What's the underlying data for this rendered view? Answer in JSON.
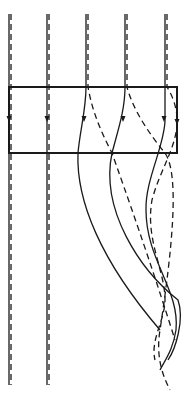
{
  "diagram": {
    "colors": {
      "stroke": "#1a1a1a",
      "background": "#ffffff"
    },
    "region_box": {
      "x": 9,
      "y": 87,
      "width": 168,
      "height": 66
    },
    "rays": [
      {
        "id": 1,
        "style": "solid",
        "path": "M9 14 L9 385",
        "arrow_at": [
          9,
          120
        ]
      },
      {
        "id": 1,
        "style": "dashed",
        "path": "M11 14 L11 385",
        "arrow_at": null
      },
      {
        "id": 2,
        "style": "solid",
        "path": "M47 14 L47 385",
        "arrow_at": [
          47,
          120
        ]
      },
      {
        "id": 2,
        "style": "dashed",
        "path": "M49 14 L49 385",
        "arrow_at": null
      },
      {
        "id": 3,
        "style": "solid",
        "path": "M86 14 L86 87 C86 110 80 130 78 153 C76 200 100 260 160 330",
        "arrow_at": [
          84,
          120
        ]
      },
      {
        "id": 3,
        "style": "dashed",
        "path": "M88 14 L88 87 C92 110 100 130 112 153 C125 190 150 260 175 340",
        "arrow_at": null
      },
      {
        "id": 4,
        "style": "solid",
        "path": "M125 14 L125 87 C125 110 118 130 112 153 C100 210 140 270 178 300 C185 320 175 350 168 360",
        "arrow_at": [
          123,
          120
        ]
      },
      {
        "id": 4,
        "style": "dashed",
        "path": "M127 14 L127 87 C133 110 150 135 165 153 C180 175 172 250 160 330 C155 360 165 380 170 390",
        "arrow_at": null
      },
      {
        "id": 5,
        "style": "solid",
        "path": "M165 14 L165 87 L165 120 C165 145 145 180 146 210 C146 260 180 290 176 330 C173 350 165 360 160 370",
        "arrow_at": [
          164,
          120
        ]
      },
      {
        "id": 5,
        "style": "dashed",
        "path": "M167 14 L167 87 C172 95 178 108 177 125 C175 150 160 170 152 200 C145 240 165 270 165 300 C165 320 150 340 155 360",
        "arrow_at": [
          177,
          123
        ]
      }
    ]
  }
}
